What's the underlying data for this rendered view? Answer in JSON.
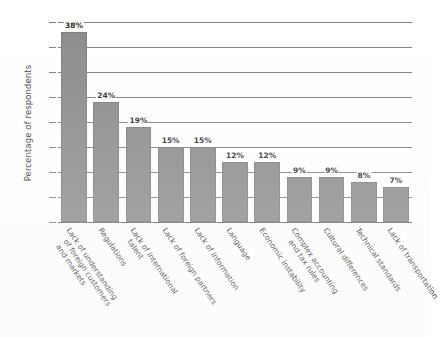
{
  "chart_data": {
    "type": "bar",
    "title": "",
    "subtitle": "",
    "xlabel": "",
    "ylabel": "Percentage of respondents",
    "ylim": [
      0,
      40
    ],
    "yticks": [
      0,
      5,
      10,
      15,
      20,
      25,
      30,
      35,
      40
    ],
    "grid": true,
    "legend": false,
    "orientation": "vertical",
    "bar_color": "#8a8a8a",
    "value_suffix": "%",
    "categories": [
      "Lack of understanding of foreign customers and markets",
      "Regulations",
      "Lack of international talent",
      "Lack of foreign partners",
      "Lack of information",
      "Language",
      "Economic instability",
      "Complex accounting and tax rules",
      "Cultural differences",
      "Technical standards",
      "Lack of transportation"
    ],
    "category_lines": [
      [
        "Lack of understanding",
        "of foreign customers",
        "and markets"
      ],
      [
        "Regulations"
      ],
      [
        "Lack of international",
        "talent"
      ],
      [
        "Lack of foreign partners"
      ],
      [
        "Lack of information"
      ],
      [
        "Language"
      ],
      [
        "Economic instability"
      ],
      [
        "Complex accounting",
        "and tax rules"
      ],
      [
        "Cultural differences"
      ],
      [
        "Technical standards"
      ],
      [
        "Lack of transportation"
      ]
    ],
    "values": [
      38,
      24,
      19,
      15,
      15,
      12,
      12,
      9,
      9,
      8,
      7
    ],
    "value_labels": [
      "38%",
      "24%",
      "19%",
      "15%",
      "15%",
      "12%",
      "12%",
      "9%",
      "9%",
      "8%",
      "7%"
    ]
  },
  "colors": {
    "bar": "#8a8a8a",
    "gridline": "#7e7e7e",
    "text": "#2f2f2f",
    "background": "#ffffff"
  }
}
